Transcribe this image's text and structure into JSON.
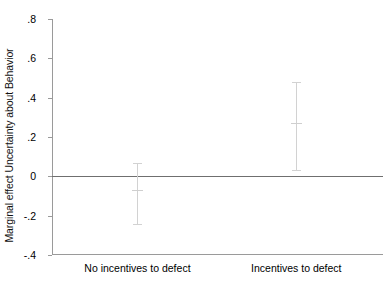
{
  "chart_data": {
    "type": "scatter",
    "title": "",
    "xlabel": "",
    "ylabel": "Marginal effect Uncertainty about Behavior",
    "categories": [
      "No incentives to defect",
      "Incentives to defect"
    ],
    "ylim": [
      -0.4,
      0.8
    ],
    "yticks": [
      0.8,
      0.6,
      0.4,
      0.2,
      0,
      -0.2,
      -0.4
    ],
    "ytick_labels": [
      ".8",
      ".6",
      ".4",
      ".2",
      "0",
      "-.2",
      "-.4"
    ],
    "grid": false,
    "legend": null,
    "reference_line": {
      "value": 0,
      "label": "zero-line",
      "color": "#6f6f6f"
    },
    "marker_color": "#cfcfcf",
    "errorbar_color": "#d2d2d2",
    "axis_color": "#9a9a9a",
    "series": [
      {
        "name": "Marginal effect",
        "points": [
          {
            "category": "No incentives to defect",
            "x": 0,
            "value": -0.07,
            "ci_low": -0.24,
            "ci_high": 0.07
          },
          {
            "category": "Incentives to defect",
            "x": 1,
            "value": 0.27,
            "ci_low": 0.03,
            "ci_high": 0.48
          }
        ]
      }
    ]
  }
}
